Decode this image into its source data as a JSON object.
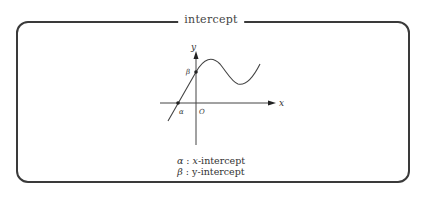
{
  "frame": {
    "title": "intercept"
  },
  "graph": {
    "x_axis_label": "x",
    "y_axis_label": "y",
    "origin_label": "O",
    "alpha_label": "α",
    "beta_label": "β"
  },
  "legend": [
    {
      "symbol": "α",
      "sep": " : ",
      "var": "x",
      "text": "-intercept"
    },
    {
      "symbol": "β",
      "sep": " : ",
      "var": "y",
      "text": "-intercept"
    }
  ]
}
